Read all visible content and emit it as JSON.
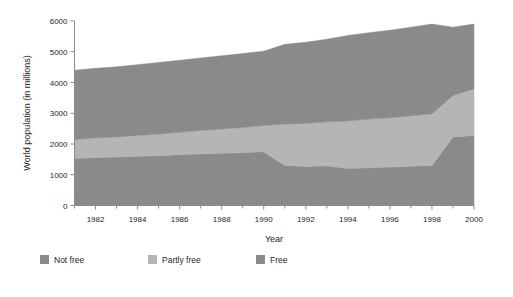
{
  "chart_data": {
    "type": "area",
    "stacked": true,
    "title": "",
    "xlabel": "Year",
    "ylabel": "World population (in millions)",
    "xlim": [
      1981,
      2000
    ],
    "ylim": [
      0,
      6000
    ],
    "grid": false,
    "legend_position": "bottom",
    "x": [
      1981,
      1982,
      1983,
      1984,
      1985,
      1986,
      1987,
      1988,
      1989,
      1990,
      1991,
      1992,
      1993,
      1994,
      1995,
      1996,
      1997,
      1998,
      1999,
      2000
    ],
    "x_tick_labels": [
      "1982",
      "1984",
      "1986",
      "1988",
      "1990",
      "1992",
      "1994",
      "1996",
      "1998",
      "2000"
    ],
    "x_tick_values": [
      1982,
      1984,
      1986,
      1988,
      1990,
      1992,
      1994,
      1996,
      1998,
      2000
    ],
    "x_minor_tick_values": [
      1981,
      1983,
      1985,
      1987,
      1989,
      1991,
      1993,
      1995,
      1997,
      1999
    ],
    "y_tick_labels": [
      "0",
      "1000",
      "2000",
      "3000",
      "4000",
      "5000",
      "6000"
    ],
    "y_tick_values": [
      0,
      1000,
      2000,
      3000,
      4000,
      5000,
      6000
    ],
    "series": [
      {
        "name": "Free",
        "color": "#8a8a8a",
        "stack_order": 1,
        "values": [
          1530,
          1560,
          1580,
          1600,
          1620,
          1650,
          1680,
          1700,
          1720,
          1750,
          1300,
          1270,
          1290,
          1200,
          1230,
          1250,
          1280,
          1300,
          2230,
          2280
        ]
      },
      {
        "name": "Partly free",
        "color": "#b5b5b5",
        "stack_order": 2,
        "values": [
          620,
          640,
          650,
          680,
          700,
          730,
          760,
          790,
          820,
          850,
          1350,
          1400,
          1430,
          1550,
          1580,
          1600,
          1640,
          1680,
          1350,
          1520
        ]
      },
      {
        "name": "Not free",
        "color": "#8a8a8a",
        "stack_order": 3,
        "values": [
          2250,
          2260,
          2280,
          2300,
          2330,
          2340,
          2360,
          2380,
          2400,
          2420,
          2590,
          2640,
          2690,
          2780,
          2810,
          2850,
          2880,
          2920,
          2220,
          2100
        ]
      }
    ],
    "cumulative_totals": [
      4400,
      4460,
      4510,
      4580,
      4650,
      4720,
      4800,
      4870,
      4940,
      5020,
      5240,
      5310,
      5410,
      5530,
      5620,
      5700,
      5800,
      5900,
      5800,
      5900
    ]
  },
  "legend": {
    "items": [
      {
        "label": "Not free",
        "color": "#8a8a8a"
      },
      {
        "label": "Partly free",
        "color": "#b5b5b5"
      },
      {
        "label": "Free",
        "color": "#8a8a8a"
      }
    ]
  },
  "axes": {
    "x_title": "Year",
    "y_title": "World population (in millions)"
  }
}
